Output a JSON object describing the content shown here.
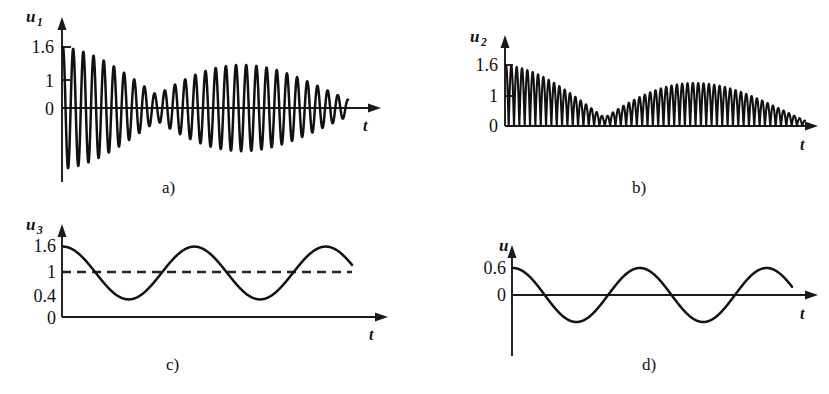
{
  "figure": {
    "background": "#ffffff",
    "ink_color": "#111111",
    "panel_count": 4
  },
  "panels": [
    {
      "id": "a",
      "caption": "a)",
      "y_axis_label": "u",
      "y_axis_subscript": "1",
      "x_axis_label": "t",
      "y_ticks": [
        "1.6",
        "1",
        "0"
      ],
      "zero_label": "0"
    },
    {
      "id": "b",
      "caption": "b)",
      "y_axis_label": "u",
      "y_axis_subscript": "2",
      "x_axis_label": "t",
      "y_ticks": [
        "1.6",
        "1",
        "0"
      ],
      "zero_label": "0"
    },
    {
      "id": "c",
      "caption": "c)",
      "y_axis_label": "u",
      "y_axis_subscript": "3",
      "x_axis_label": "t",
      "y_ticks": [
        "1.6",
        "1",
        "0.4",
        "0"
      ],
      "zero_label": "0"
    },
    {
      "id": "d",
      "caption": "d)",
      "y_axis_label": "u",
      "y_axis_subscript": "",
      "x_axis_label": "t",
      "y_ticks": [
        "0.6",
        "0"
      ],
      "zero_label": "0"
    }
  ],
  "chart_data": [
    {
      "type": "line",
      "id": "a",
      "title": "",
      "xlabel": "t",
      "ylabel": "u1",
      "description": "Amplitude-modulated beat oscillation about zero; two beat groups separated by a node",
      "ylim": [
        -1.7,
        1.7
      ],
      "tick_values": [
        1.6,
        1,
        0
      ],
      "grid": false,
      "legend": null,
      "waveform": {
        "kind": "beat",
        "carrier_cycles": 28,
        "envelope_amplitude": 1.6,
        "envelope_beats": 2,
        "envelope_min": 0.25,
        "decay": 0.55,
        "node_position_fraction": 0.33,
        "rectified": false
      }
    },
    {
      "type": "line",
      "id": "b",
      "title": "",
      "xlabel": "t",
      "ylabel": "u2",
      "description": "Rectified beat oscillation, all lobes positive, touching zero between lobes",
      "ylim": [
        0,
        1.75
      ],
      "tick_values": [
        1.6,
        1,
        0
      ],
      "grid": false,
      "legend": null,
      "waveform": {
        "kind": "beat",
        "carrier_cycles": 28,
        "envelope_amplitude": 1.6,
        "envelope_beats": 2,
        "envelope_min": 0.16,
        "decay": 0.55,
        "node_position_fraction": 0.33,
        "rectified": true
      }
    },
    {
      "type": "line",
      "id": "c",
      "title": "",
      "xlabel": "t",
      "ylabel": "u3",
      "description": "Slow cosine envelope oscillating between 1.6 and 0.4 with dashed reference line at 1",
      "ylim": [
        0,
        1.8
      ],
      "tick_values": [
        1.6,
        1,
        0.4,
        0
      ],
      "grid": false,
      "legend": null,
      "reference_line": {
        "value": 1,
        "style": "dashed"
      },
      "waveform": {
        "kind": "cosine",
        "max": 1.6,
        "min": 0.4,
        "mean": 1.0,
        "amplitude": 0.6,
        "cycles": 2.2,
        "phase": "starts at maximum"
      }
    },
    {
      "type": "line",
      "id": "d",
      "title": "",
      "xlabel": "t",
      "ylabel": "u",
      "description": "Cosine about zero with amplitude 0.6",
      "ylim": [
        -0.8,
        0.8
      ],
      "tick_values": [
        0.6,
        0
      ],
      "grid": false,
      "legend": null,
      "waveform": {
        "kind": "cosine",
        "max": 0.6,
        "min": -0.6,
        "mean": 0,
        "amplitude": 0.6,
        "cycles": 2.2,
        "phase": "starts at maximum"
      }
    }
  ]
}
